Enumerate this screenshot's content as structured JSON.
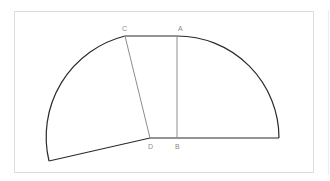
{
  "diagram": {
    "labels": {
      "A": "A",
      "B": "B",
      "C": "C",
      "D": "D"
    },
    "colors": {
      "outline": "#2a2a2a",
      "inner": "#8c8c8c",
      "frame": "#dcdcdc",
      "label": "#8a8a8a"
    },
    "points": {
      "A": [
        177,
        36
      ],
      "B": [
        177,
        138
      ],
      "C": [
        125,
        36
      ],
      "D": [
        150,
        138
      ],
      "arc_right_end": [
        279,
        138
      ],
      "arc_left_end": [
        49,
        161
      ]
    }
  }
}
